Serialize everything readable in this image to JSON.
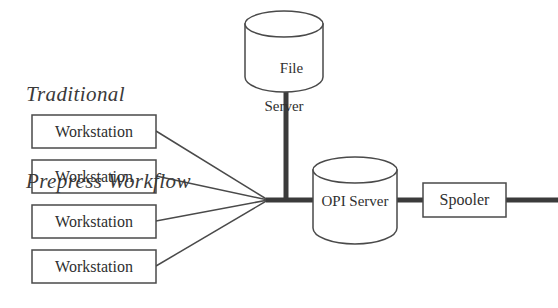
{
  "figure": {
    "title_line_1": "Traditional",
    "title_line_2": "Prepress Workflow",
    "background_color": "#ffffff",
    "line_color": "#4a4a4a",
    "thick_line_color": "#3b3b3b",
    "text_color": "#2f2f2f"
  },
  "workstations": [
    {
      "label": "Workstation"
    },
    {
      "label": "Workstation"
    },
    {
      "label": "Workstation"
    },
    {
      "label": "Workstation"
    }
  ],
  "file_server": {
    "label_line_1": "File",
    "label_line_2": "Server",
    "shape": "cylinder"
  },
  "opi_server": {
    "label": "OPI Server",
    "shape": "cylinder"
  },
  "spooler": {
    "label": "Spooler",
    "shape": "rectangle"
  },
  "connections": {
    "workstation_fan_count": 4,
    "trunk_label": "file-server-trunk",
    "backbone_label": "network-backbone"
  }
}
